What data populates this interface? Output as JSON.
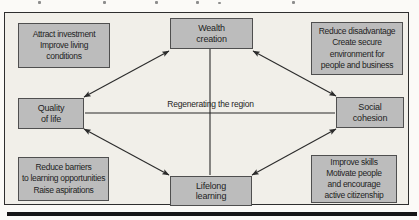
{
  "figure": {
    "center_label": "Regenerating the region",
    "nodes": {
      "wealth": [
        "Wealth",
        "creation"
      ],
      "quality": [
        "Quality",
        "of life"
      ],
      "social": [
        "Social",
        "cohesion"
      ],
      "lifelong": [
        "Lifelong",
        "learning"
      ]
    },
    "annotations": {
      "top_left": [
        "Attract investment",
        "Improve living",
        "conditions"
      ],
      "top_right": [
        "Reduce disadvantage",
        "Create secure",
        "environment for",
        "people and business"
      ],
      "bottom_left": [
        "Reduce barriers",
        "to learning opportunities",
        "Raise aspirations"
      ],
      "bottom_right": [
        "Improve skills",
        "Motivate people",
        "and encourage",
        "active citizenship"
      ]
    },
    "connections": [
      {
        "from": "quality-of-life",
        "to": "wealth-creation",
        "arrows": "both"
      },
      {
        "from": "wealth-creation",
        "to": "social-cohesion",
        "arrows": "both"
      },
      {
        "from": "quality-of-life",
        "to": "lifelong-learning",
        "arrows": "both"
      },
      {
        "from": "lifelong-learning",
        "to": "social-cohesion",
        "arrows": "both"
      },
      {
        "from": "quality-of-life",
        "to": "social-cohesion",
        "arrows": "none"
      },
      {
        "from": "wealth-creation",
        "to": "lifelong-learning",
        "arrows": "none"
      }
    ],
    "colors": {
      "box_fill": "#bcbcbc",
      "box_border": "#4f4f4f",
      "connector": "#2b2b2b",
      "frame_background": "#f1efe9",
      "page_background": "#fbfaf7",
      "frame_border": "#2e2e2e"
    }
  }
}
